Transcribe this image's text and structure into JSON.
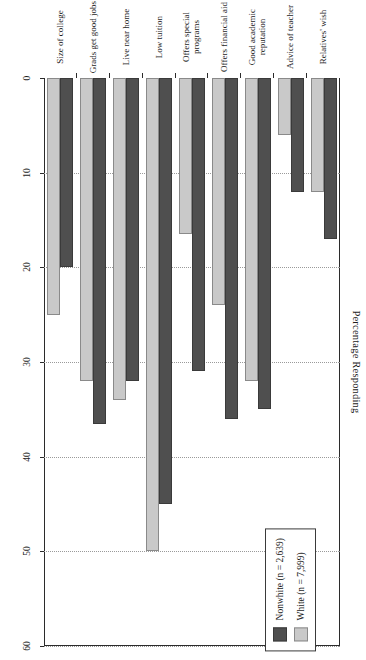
{
  "chart_data": {
    "type": "bar",
    "orientation": "horizontal",
    "title": "Percentage Responding",
    "xlabel": "Percentage Responding",
    "ylabel": "",
    "xlim": [
      0,
      60
    ],
    "xticks": [
      0,
      10,
      20,
      30,
      40,
      50,
      60
    ],
    "xtick_labels": [
      "0",
      "10",
      "20",
      "30",
      "40",
      "50",
      "60"
    ],
    "grid": true,
    "legend_position": "upper right",
    "categories": [
      "Relatives' wish",
      "Advice of teacher",
      "Good academic reputation",
      "Offers financial aid",
      "Offers special programs",
      "Low tuition",
      "Live near home",
      "Grads get good jobs",
      "Size of college"
    ],
    "series": [
      {
        "name": "Nonwhite (n = 2,639)",
        "color": "#4f4f4f",
        "values": [
          17,
          12,
          35,
          36,
          31,
          45,
          32,
          36.5,
          20
        ]
      },
      {
        "name": "White (n = 7,999)",
        "color": "#c9c9c9",
        "values": [
          12,
          6,
          32,
          24,
          16.5,
          50,
          34,
          32,
          25
        ]
      }
    ]
  },
  "legend": {
    "entries": [
      {
        "label": "Nonwhite (n = 2,639)",
        "swatch": "dark"
      },
      {
        "label": "White (n = 7,999)",
        "swatch": "light"
      }
    ]
  }
}
